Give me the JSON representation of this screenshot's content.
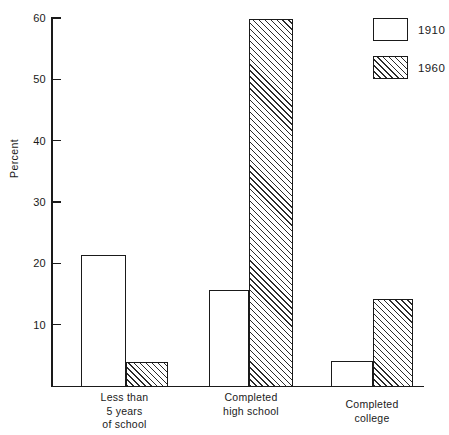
{
  "chart_data": {
    "type": "bar",
    "title": "",
    "subtitle": "",
    "xlabel": "",
    "ylabel": "Percent",
    "ylim": [
      0,
      60
    ],
    "yticks": [
      10,
      20,
      30,
      40,
      50,
      60
    ],
    "ytick_labels": [
      "10",
      "20",
      "30",
      "40",
      "50",
      "60"
    ],
    "grid": false,
    "legend_position": "top-right",
    "categories": [
      "Less than\n5 years\nof school",
      "Completed\nhigh school",
      "Completed\ncollege"
    ],
    "series": [
      {
        "name": "1910",
        "fill": "solid-white",
        "values": [
          21.3,
          15.6,
          4.1
        ]
      },
      {
        "name": "1960",
        "fill": "diagonal-hatch",
        "values": [
          3.9,
          59.8,
          14.2
        ]
      }
    ],
    "annotations": []
  },
  "legend": {
    "entries": [
      {
        "label": "1910",
        "fill": "solid-white"
      },
      {
        "label": "1960",
        "fill": "diagonal-hatch"
      }
    ]
  },
  "axis": {
    "y_title": "Percent",
    "ticks": [
      {
        "value": 60,
        "label": "60"
      },
      {
        "value": 50,
        "label": "50"
      },
      {
        "value": 40,
        "label": "40"
      },
      {
        "value": 30,
        "label": "30"
      },
      {
        "value": 20,
        "label": "20"
      },
      {
        "value": 10,
        "label": "10"
      }
    ]
  },
  "colors": {
    "ink": "#1a1a1a",
    "background": "#ffffff",
    "hatch": "#2b2b2b"
  }
}
